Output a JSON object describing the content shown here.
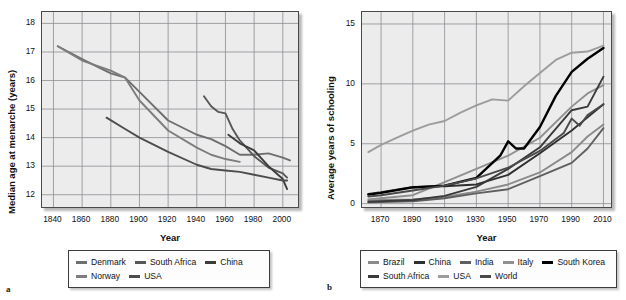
{
  "figure": {
    "panels": [
      {
        "letter": "a",
        "xlabel": "Year",
        "ylabel": "Median age at menarche (years)"
      },
      {
        "letter": "b",
        "xlabel": "Year",
        "ylabel": "Average years of schooling"
      }
    ]
  },
  "chart_data": [
    {
      "type": "line",
      "panel": "a",
      "title": "",
      "xlabel": "Year",
      "ylabel": "Median age at menarche (years)",
      "xlim": [
        1832,
        2012
      ],
      "ylim": [
        11.5,
        18.4
      ],
      "xticks": [
        1840,
        1860,
        1880,
        1900,
        1920,
        1940,
        1960,
        1980,
        2000
      ],
      "yticks": [
        12,
        13,
        14,
        15,
        16,
        17,
        18
      ],
      "grid": true,
      "legend_position": "below",
      "series": [
        {
          "name": "Denmark",
          "color": "#6e6e6e",
          "x": [
            1843,
            1860,
            1880,
            1890,
            1900,
            1920,
            1940,
            1950,
            1960,
            1970,
            1980,
            1990,
            2000,
            2005
          ],
          "y": [
            17.2,
            16.75,
            16.25,
            16.1,
            15.6,
            14.6,
            14.1,
            13.95,
            13.7,
            13.4,
            13.4,
            13.45,
            13.3,
            13.2
          ]
        },
        {
          "name": "South Africa",
          "color": "#575757",
          "x": [
            1945,
            1950,
            1955,
            1960,
            1965,
            1970,
            1980,
            1990,
            2000,
            2003
          ],
          "y": [
            15.45,
            15.1,
            14.9,
            14.85,
            14.3,
            13.9,
            13.35,
            12.95,
            12.75,
            12.6
          ]
        },
        {
          "name": "China",
          "color": "#3d3d3d",
          "x": [
            1962,
            1970,
            1980,
            1990,
            2000,
            2003
          ],
          "y": [
            14.1,
            13.8,
            13.55,
            13.0,
            12.55,
            12.2
          ]
        },
        {
          "name": "Norway",
          "color": "#7d7d7d",
          "x": [
            1843,
            1860,
            1880,
            1890,
            1900,
            1920,
            1940,
            1950,
            1960,
            1970
          ],
          "y": [
            17.2,
            16.7,
            16.35,
            16.1,
            15.3,
            14.25,
            13.65,
            13.4,
            13.25,
            13.15
          ]
        },
        {
          "name": "USA",
          "color": "#4d4d4d",
          "x": [
            1877,
            1890,
            1900,
            1920,
            1940,
            1950,
            1960,
            1970,
            1980,
            1990,
            2000,
            2003
          ],
          "y": [
            14.7,
            14.3,
            14.0,
            13.5,
            13.05,
            12.9,
            12.85,
            12.8,
            12.7,
            12.6,
            12.5,
            12.5
          ]
        }
      ]
    },
    {
      "type": "line",
      "panel": "b",
      "title": "",
      "xlabel": "Year",
      "ylabel": "Average years of schooling",
      "xlim": [
        1858,
        2016
      ],
      "ylim": [
        -0.45,
        16.0
      ],
      "xticks": [
        1870,
        1890,
        1910,
        1930,
        1950,
        1970,
        1990,
        2010
      ],
      "yticks": [
        0,
        5,
        10,
        15
      ],
      "grid": true,
      "legend_position": "below",
      "series": [
        {
          "name": "Brazil",
          "color": "#8a8a8a",
          "x": [
            1862,
            1870,
            1890,
            1910,
            1930,
            1950,
            1970,
            1990,
            2000,
            2010
          ],
          "y": [
            0.25,
            0.3,
            0.35,
            0.55,
            1.0,
            1.6,
            2.6,
            4.3,
            5.6,
            6.6
          ]
        },
        {
          "name": "China",
          "color": "#2f2f2f",
          "x": [
            1862,
            1870,
            1890,
            1910,
            1930,
            1950,
            1970,
            1990,
            2000,
            2010
          ],
          "y": [
            0.8,
            0.95,
            1.4,
            1.45,
            1.6,
            2.4,
            4.2,
            6.1,
            7.2,
            8.3
          ]
        },
        {
          "name": "India",
          "color": "#5f5f5f",
          "x": [
            1862,
            1870,
            1890,
            1910,
            1930,
            1950,
            1970,
            1990,
            2000,
            2010
          ],
          "y": [
            0.1,
            0.12,
            0.2,
            0.45,
            0.85,
            1.2,
            2.3,
            3.4,
            4.6,
            6.3
          ]
        },
        {
          "name": "Italy",
          "color": "#909090",
          "x": [
            1862,
            1870,
            1890,
            1910,
            1930,
            1950,
            1970,
            1990,
            2000,
            2010
          ],
          "y": [
            0.35,
            0.45,
            0.7,
            1.8,
            2.9,
            4.0,
            5.5,
            8.1,
            9.2,
            9.9
          ]
        },
        {
          "name": "South Korea",
          "color": "#000000",
          "x": [
            1862,
            1870,
            1890,
            1910,
            1930,
            1945,
            1950,
            1955,
            1960,
            1970,
            1980,
            1990,
            2000,
            2010
          ],
          "y": [
            0.75,
            0.9,
            1.35,
            1.5,
            2.15,
            4.0,
            5.2,
            4.6,
            4.6,
            6.4,
            9.0,
            11.0,
            12.1,
            13.0
          ]
        },
        {
          "name": "South Africa",
          "color": "#3a3a3a",
          "x": [
            1862,
            1870,
            1890,
            1910,
            1930,
            1950,
            1970,
            1990,
            2000,
            2010
          ],
          "y": [
            0.15,
            0.2,
            0.3,
            0.65,
            1.4,
            2.9,
            4.7,
            7.8,
            8.1,
            10.6
          ]
        },
        {
          "name": "USA",
          "color": "#9c9c9c",
          "x": [
            1862,
            1870,
            1880,
            1890,
            1900,
            1910,
            1920,
            1930,
            1940,
            1950,
            1960,
            1970,
            1980,
            1990,
            2000,
            2010
          ],
          "y": [
            4.3,
            4.9,
            5.5,
            6.1,
            6.6,
            6.9,
            7.6,
            8.2,
            8.7,
            8.6,
            9.8,
            10.9,
            12.0,
            12.6,
            12.7,
            13.2
          ]
        },
        {
          "name": "World",
          "color": "#4a4a4a",
          "x": [
            1862,
            1870,
            1890,
            1910,
            1930,
            1950,
            1970,
            1985,
            1990,
            1995,
            2000,
            2010
          ],
          "y": [
            0.6,
            0.7,
            1.1,
            1.5,
            2.1,
            3.0,
            4.4,
            5.9,
            7.1,
            6.5,
            7.4,
            8.3
          ]
        }
      ]
    }
  ],
  "panels": [
    {
      "letter": "a",
      "xlabel": "Year",
      "ylabel": "Median age at menarche (years)",
      "xticks": [
        "1840",
        "1860",
        "1880",
        "1900",
        "1920",
        "1940",
        "1960",
        "1980",
        "2000"
      ],
      "yticks": [
        "18",
        "17",
        "16",
        "15",
        "14",
        "13",
        "12"
      ],
      "legend": [
        [
          {
            "label": "Denmark",
            "color": "#6e6e6e"
          },
          {
            "label": "South Africa",
            "color": "#575757"
          },
          {
            "label": "China",
            "color": "#3d3d3d"
          }
        ],
        [
          {
            "label": "Norway",
            "color": "#7d7d7d"
          },
          {
            "label": "USA",
            "color": "#4d4d4d"
          }
        ]
      ]
    },
    {
      "letter": "b",
      "xlabel": "Year",
      "ylabel": "Average years of schooling",
      "xticks": [
        "1870",
        "1890",
        "1910",
        "1930",
        "1950",
        "1970",
        "1990",
        "2010"
      ],
      "yticks": [
        "15",
        "10",
        "5",
        "0"
      ],
      "legend": [
        [
          {
            "label": "Brazil",
            "color": "#8a8a8a"
          },
          {
            "label": "China",
            "color": "#2f2f2f"
          },
          {
            "label": "India",
            "color": "#5f5f5f"
          },
          {
            "label": "Italy",
            "color": "#909090"
          },
          {
            "label": "South Korea",
            "color": "#000000"
          }
        ],
        [
          {
            "label": "South Africa",
            "color": "#3a3a3a"
          },
          {
            "label": "USA",
            "color": "#9c9c9c"
          },
          {
            "label": "World",
            "color": "#4a4a4a"
          }
        ]
      ]
    }
  ],
  "style": {
    "plot_bg": "#ececed",
    "grid_color": "#8d8d93",
    "axis_color": "#4a4a4a"
  }
}
